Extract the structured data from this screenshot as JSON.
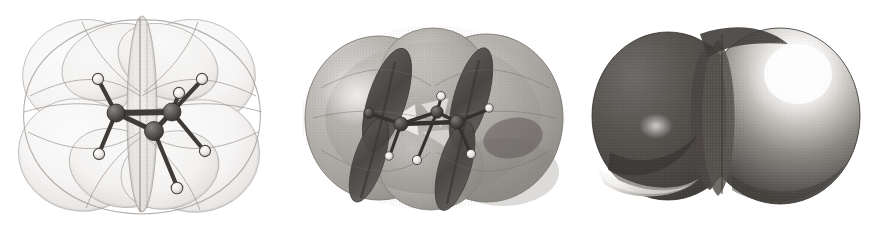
{
  "figure": {
    "background_color": "#ffffff",
    "width": 873,
    "height": 231,
    "panel_count": 3
  },
  "palette": {
    "background": "#ffffff",
    "surface_light": "#f2f1f0",
    "surface_light_edge": "#b9b6b3",
    "stipple_dots": "#8e8a86",
    "surface_mid": "#a6a29e",
    "surface_mid_light": "#cac6c2",
    "surface_mid_shadow": "#7d7975",
    "lobe_dark": "#4e4a47",
    "lobe_darker": "#3a3734",
    "solid_dark": "#55514e",
    "solid_darker": "#403d3a",
    "solid_light": "#f6f5f4",
    "solid_mid": "#9b9793",
    "carbon_atom": "#4a4744",
    "carbon_atom_hi": "#6f6b67",
    "hydrogen_atom": "#e8e6e4",
    "hydrogen_atom_edge": "#4a4744",
    "bond": "#3e3b38"
  },
  "panels": [
    {
      "id": "panel-1",
      "name": "low-isosurface-panel",
      "label": "a",
      "surface_style": "stippled-translucent-light",
      "surface_opacity": "low",
      "lobe_count": 6,
      "molecule_visible": true,
      "description": "Large pale stippled electron-density envelope with six bulging lobes; ball-and-stick ethane skeleton clearly visible inside"
    },
    {
      "id": "panel-2",
      "name": "medium-isosurface-panel",
      "label": "b",
      "surface_style": "translucent-grey-with-dark-lobes",
      "surface_opacity": "medium",
      "lobe_count": 6,
      "molecule_visible": true,
      "description": "Medium grey translucent surface crossed by two dark elongated lobes running diagonally; ball-and-stick ethane skeleton partly obscured"
    },
    {
      "id": "panel-3",
      "name": "high-isosurface-panel",
      "label": "c",
      "surface_style": "opaque-shaded-solid",
      "surface_opacity": "opaque",
      "lobe_count": 2,
      "molecule_visible": false,
      "description": "Opaque space-filling two-lobed surface with strong specular highlight on the upper-right sphere and a crescent highlight at the lower left"
    }
  ],
  "molecule": {
    "name": "ethane",
    "formula": "C2H6",
    "carbon_count": 2,
    "hydrogen_count": 6,
    "conformation": "staggered",
    "carbon_label": "C",
    "hydrogen_label": "H"
  }
}
